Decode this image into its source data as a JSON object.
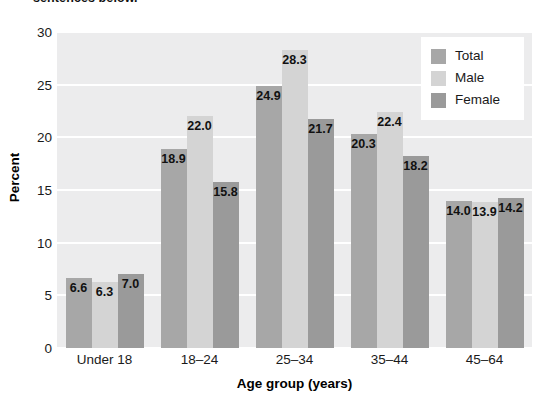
{
  "caption_fragment": "sentences below.",
  "chart_data": {
    "type": "bar",
    "title": "",
    "xlabel": "Age group (years)",
    "ylabel": "Percent",
    "categories": [
      "Under 18",
      "18–24",
      "25–34",
      "35–44",
      "45–64"
    ],
    "series": [
      {
        "name": "Total",
        "color": "#a7a7a7",
        "values": [
          6.6,
          18.9,
          24.9,
          20.3,
          14.0
        ]
      },
      {
        "name": "Male",
        "color": "#d4d4d4",
        "values": [
          6.3,
          22.0,
          28.3,
          22.4,
          13.9
        ]
      },
      {
        "name": "Female",
        "color": "#9a9a9a",
        "values": [
          7.0,
          15.8,
          21.7,
          18.2,
          14.2
        ]
      }
    ],
    "value_labels": [
      [
        "6.6",
        "6.3",
        "7.0"
      ],
      [
        "18.9",
        "22.0",
        "15.8"
      ],
      [
        "24.9",
        "28.3",
        "21.7"
      ],
      [
        "20.3",
        "22.4",
        "18.2"
      ],
      [
        "14.0",
        "13.9",
        "14.2"
      ]
    ],
    "ylim": [
      0,
      30
    ],
    "yticks": [
      0,
      5,
      10,
      15,
      20,
      25,
      30
    ],
    "ytick_labels": [
      "0",
      "5",
      "10",
      "15",
      "20",
      "25",
      "30"
    ],
    "grid": true,
    "grid_color": "#ffffff",
    "plot_background": "#ececed",
    "legend_position": "top-right",
    "legend_entries": [
      "Total",
      "Male",
      "Female"
    ]
  }
}
